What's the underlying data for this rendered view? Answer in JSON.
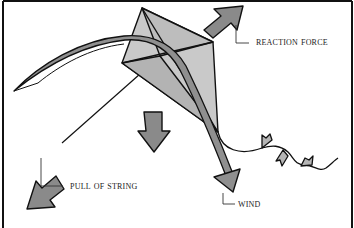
{
  "diagram": {
    "colors": {
      "outline": "#111111",
      "kite_fill": "#c4c4c4",
      "kite_fill_dark": "#a9a9a9",
      "arrow_fill": "#8a8a8a",
      "arrow_fill_light": "#9d9d9d",
      "background": "#ffffff"
    },
    "labels": {
      "reaction_force": "Reaction Force",
      "pull_of_string": "Pull of String",
      "wind": "Wind"
    },
    "elements": [
      {
        "id": "kite",
        "type": "kite-shape"
      },
      {
        "id": "wind-arrow",
        "type": "curved-arrow",
        "label": "Wind"
      },
      {
        "id": "reaction-arrow",
        "type": "arrow",
        "direction": "up-right",
        "label": "Reaction Force"
      },
      {
        "id": "pull-arrow",
        "type": "arrow",
        "direction": "down-left",
        "label": "Pull of String"
      },
      {
        "id": "gravity-arrow",
        "type": "arrow",
        "direction": "down"
      },
      {
        "id": "kite-string",
        "type": "line"
      },
      {
        "id": "kite-tail",
        "type": "tail-with-bows",
        "bows": 3
      }
    ]
  }
}
